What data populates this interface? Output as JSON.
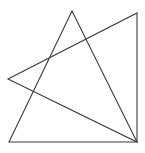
{
  "canvas": {
    "width": 145,
    "height": 153,
    "background_color": "#ffffff",
    "description": "Two overlapping outlined triangles drawn in thin dark gray lines on a plain white background"
  },
  "style": {
    "stroke_color": "#3c3c3c",
    "stroke_width": 1.1,
    "fill": "none"
  },
  "shapes": [
    {
      "name": "triangle-upper",
      "type": "triangle",
      "points": "72,11 9,142 137,142",
      "vertices": [
        {
          "label": "apex-top",
          "x": 72,
          "y": 11
        },
        {
          "label": "bottom-left",
          "x": 9,
          "y": 142
        },
        {
          "label": "bottom-right",
          "x": 137,
          "y": 142
        }
      ]
    },
    {
      "name": "triangle-right",
      "type": "triangle",
      "points": "8,79 137,13 137,142",
      "vertices": [
        {
          "label": "left-point",
          "x": 8,
          "y": 79
        },
        {
          "label": "top-right",
          "x": 137,
          "y": 13
        },
        {
          "label": "bottom-right",
          "x": 137,
          "y": 142
        }
      ]
    }
  ],
  "intersections": [
    {
      "name": "crossing-upper-right",
      "x": 86,
      "y": 40
    },
    {
      "name": "crossing-upper-left",
      "x": 50,
      "y": 57
    },
    {
      "name": "crossing-lower-left",
      "x": 32,
      "y": 95
    }
  ]
}
